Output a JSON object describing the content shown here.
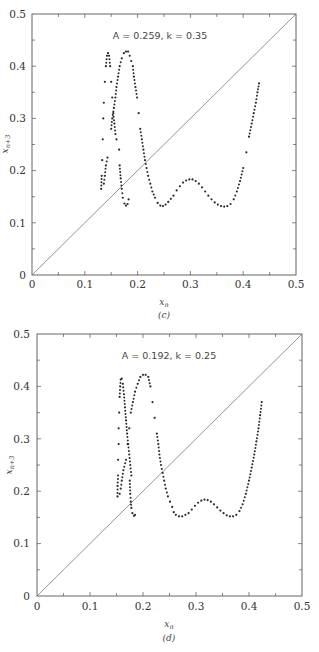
{
  "chart_data": [
    {
      "id": "c",
      "type": "scatter",
      "title": "A = 0.259, k = 0.35",
      "caption": "(c)",
      "xlabel": "x_n",
      "ylabel": "x_{n+3}",
      "xlim": [
        0,
        0.5
      ],
      "ylim": [
        0,
        0.5
      ],
      "xticks": [
        0,
        0.1,
        0.2,
        0.3,
        0.4,
        0.5
      ],
      "yticks": [
        0,
        0.1,
        0.2,
        0.3,
        0.4,
        0.5
      ],
      "xtick_labels": [
        "0",
        "0.1",
        "0.2",
        "0.3",
        "0.4",
        "0.5"
      ],
      "ytick_labels": [
        "0",
        "0.1",
        "0.2",
        "0.3",
        "0.4",
        "0.5"
      ],
      "grid": false,
      "reference_line": {
        "label": "x_{n+3} = x_n",
        "from": [
          0,
          0
        ],
        "to": [
          0.5,
          0.5
        ]
      },
      "series": [
        {
          "name": "return map",
          "points": [
            [
              0.131,
              0.165
            ],
            [
              0.132,
              0.19
            ],
            [
              0.133,
              0.22
            ],
            [
              0.134,
              0.26
            ],
            [
              0.135,
              0.3
            ],
            [
              0.136,
              0.33
            ],
            [
              0.138,
              0.37
            ],
            [
              0.14,
              0.4
            ],
            [
              0.142,
              0.42
            ],
            [
              0.144,
              0.425
            ],
            [
              0.146,
              0.42
            ],
            [
              0.148,
              0.4
            ],
            [
              0.15,
              0.37
            ],
            [
              0.152,
              0.34
            ],
            [
              0.154,
              0.31
            ],
            [
              0.156,
              0.29
            ],
            [
              0.158,
              0.27
            ],
            [
              0.16,
              0.26
            ],
            [
              0.136,
              0.175
            ],
            [
              0.138,
              0.19
            ],
            [
              0.14,
              0.21
            ],
            [
              0.143,
              0.225
            ],
            [
              0.15,
              0.28
            ],
            [
              0.152,
              0.3
            ],
            [
              0.155,
              0.32
            ],
            [
              0.158,
              0.34
            ],
            [
              0.16,
              0.36
            ],
            [
              0.163,
              0.38
            ],
            [
              0.166,
              0.4
            ],
            [
              0.17,
              0.415
            ],
            [
              0.174,
              0.425
            ],
            [
              0.178,
              0.428
            ],
            [
              0.182,
              0.428
            ],
            [
              0.185,
              0.42
            ],
            [
              0.188,
              0.41
            ],
            [
              0.191,
              0.4
            ],
            [
              0.193,
              0.38
            ],
            [
              0.196,
              0.36
            ],
            [
              0.199,
              0.34
            ],
            [
              0.202,
              0.31
            ],
            [
              0.205,
              0.28
            ],
            [
              0.208,
              0.26
            ],
            [
              0.211,
              0.24
            ],
            [
              0.214,
              0.22
            ],
            [
              0.217,
              0.205
            ],
            [
              0.22,
              0.19
            ],
            [
              0.224,
              0.175
            ],
            [
              0.228,
              0.16
            ],
            [
              0.233,
              0.148
            ],
            [
              0.238,
              0.138
            ],
            [
              0.243,
              0.133
            ],
            [
              0.248,
              0.132
            ],
            [
              0.253,
              0.135
            ],
            [
              0.258,
              0.14
            ],
            [
              0.263,
              0.146
            ],
            [
              0.268,
              0.152
            ],
            [
              0.165,
              0.24
            ],
            [
              0.166,
              0.21
            ],
            [
              0.168,
              0.185
            ],
            [
              0.17,
              0.165
            ],
            [
              0.172,
              0.148
            ],
            [
              0.175,
              0.137
            ],
            [
              0.178,
              0.133
            ],
            [
              0.181,
              0.136
            ],
            [
              0.183,
              0.145
            ],
            [
              0.274,
              0.162
            ],
            [
              0.28,
              0.17
            ],
            [
              0.286,
              0.177
            ],
            [
              0.292,
              0.181
            ],
            [
              0.298,
              0.183
            ],
            [
              0.304,
              0.183
            ],
            [
              0.31,
              0.18
            ],
            [
              0.316,
              0.175
            ],
            [
              0.322,
              0.168
            ],
            [
              0.328,
              0.16
            ],
            [
              0.334,
              0.152
            ],
            [
              0.34,
              0.145
            ],
            [
              0.346,
              0.139
            ],
            [
              0.352,
              0.135
            ],
            [
              0.358,
              0.132
            ],
            [
              0.364,
              0.131
            ],
            [
              0.37,
              0.132
            ],
            [
              0.376,
              0.136
            ],
            [
              0.382,
              0.145
            ],
            [
              0.388,
              0.16
            ],
            [
              0.394,
              0.18
            ],
            [
              0.4,
              0.205
            ],
            [
              0.406,
              0.235
            ],
            [
              0.411,
              0.265
            ],
            [
              0.416,
              0.29
            ],
            [
              0.42,
              0.31
            ],
            [
              0.424,
              0.33
            ],
            [
              0.427,
              0.35
            ],
            [
              0.43,
              0.367
            ]
          ]
        }
      ]
    },
    {
      "id": "d",
      "type": "scatter",
      "title": "A = 0.192, k = 0.25",
      "caption": "(d)",
      "xlabel": "x_n",
      "ylabel": "x_{n+3}",
      "xlim": [
        0,
        0.5
      ],
      "ylim": [
        0,
        0.5
      ],
      "xticks": [
        0,
        0.1,
        0.2,
        0.3,
        0.4,
        0.5
      ],
      "yticks": [
        0,
        0.1,
        0.2,
        0.3,
        0.4,
        0.5
      ],
      "xtick_labels": [
        "0",
        "0.1",
        "0.2",
        "0.3",
        "0.4",
        "0.5"
      ],
      "ytick_labels": [
        "0",
        "0.1",
        "0.2",
        "0.3",
        "0.4",
        "0.5"
      ],
      "grid": false,
      "reference_line": {
        "label": "x_{n+3} = x_n",
        "from": [
          0,
          0
        ],
        "to": [
          0.5,
          0.5
        ]
      },
      "series": [
        {
          "name": "return map",
          "points": [
            [
              0.152,
              0.19
            ],
            [
              0.152,
              0.21
            ],
            [
              0.153,
              0.23
            ],
            [
              0.153,
              0.26
            ],
            [
              0.154,
              0.29
            ],
            [
              0.154,
              0.32
            ],
            [
              0.155,
              0.35
            ],
            [
              0.156,
              0.38
            ],
            [
              0.157,
              0.4
            ],
            [
              0.158,
              0.413
            ],
            [
              0.16,
              0.415
            ],
            [
              0.162,
              0.405
            ],
            [
              0.164,
              0.385
            ],
            [
              0.166,
              0.36
            ],
            [
              0.168,
              0.335
            ],
            [
              0.17,
              0.31
            ],
            [
              0.172,
              0.29
            ],
            [
              0.174,
              0.27
            ],
            [
              0.176,
              0.25
            ],
            [
              0.178,
              0.23
            ],
            [
              0.156,
              0.195
            ],
            [
              0.158,
              0.205
            ],
            [
              0.16,
              0.22
            ],
            [
              0.163,
              0.24
            ],
            [
              0.168,
              0.26
            ],
            [
              0.171,
              0.29
            ],
            [
              0.174,
              0.32
            ],
            [
              0.177,
              0.35
            ],
            [
              0.181,
              0.37
            ],
            [
              0.185,
              0.39
            ],
            [
              0.19,
              0.405
            ],
            [
              0.195,
              0.418
            ],
            [
              0.2,
              0.422
            ],
            [
              0.205,
              0.422
            ],
            [
              0.21,
              0.418
            ],
            [
              0.214,
              0.4
            ],
            [
              0.218,
              0.37
            ],
            [
              0.222,
              0.34
            ],
            [
              0.226,
              0.31
            ],
            [
              0.229,
              0.29
            ],
            [
              0.231,
              0.27
            ],
            [
              0.234,
              0.25
            ],
            [
              0.237,
              0.235
            ],
            [
              0.24,
              0.22
            ],
            [
              0.243,
              0.205
            ],
            [
              0.247,
              0.19
            ],
            [
              0.251,
              0.18
            ],
            [
              0.255,
              0.17
            ],
            [
              0.258,
              0.16
            ],
            [
              0.262,
              0.155
            ],
            [
              0.268,
              0.152
            ],
            [
              0.274,
              0.152
            ],
            [
              0.28,
              0.155
            ],
            [
              0.286,
              0.158
            ],
            [
              0.175,
              0.22
            ],
            [
              0.176,
              0.195
            ],
            [
              0.177,
              0.18
            ],
            [
              0.178,
              0.168
            ],
            [
              0.18,
              0.158
            ],
            [
              0.183,
              0.153
            ],
            [
              0.185,
              0.155
            ],
            [
              0.292,
              0.165
            ],
            [
              0.298,
              0.172
            ],
            [
              0.304,
              0.178
            ],
            [
              0.31,
              0.182
            ],
            [
              0.316,
              0.184
            ],
            [
              0.322,
              0.183
            ],
            [
              0.328,
              0.18
            ],
            [
              0.334,
              0.175
            ],
            [
              0.34,
              0.169
            ],
            [
              0.346,
              0.163
            ],
            [
              0.352,
              0.158
            ],
            [
              0.358,
              0.154
            ],
            [
              0.364,
              0.152
            ],
            [
              0.37,
              0.152
            ],
            [
              0.376,
              0.155
            ],
            [
              0.382,
              0.162
            ],
            [
              0.388,
              0.175
            ],
            [
              0.394,
              0.195
            ],
            [
              0.4,
              0.22
            ],
            [
              0.405,
              0.245
            ],
            [
              0.41,
              0.27
            ],
            [
              0.414,
              0.295
            ],
            [
              0.418,
              0.32
            ],
            [
              0.421,
              0.345
            ],
            [
              0.424,
              0.37
            ]
          ]
        }
      ]
    }
  ]
}
